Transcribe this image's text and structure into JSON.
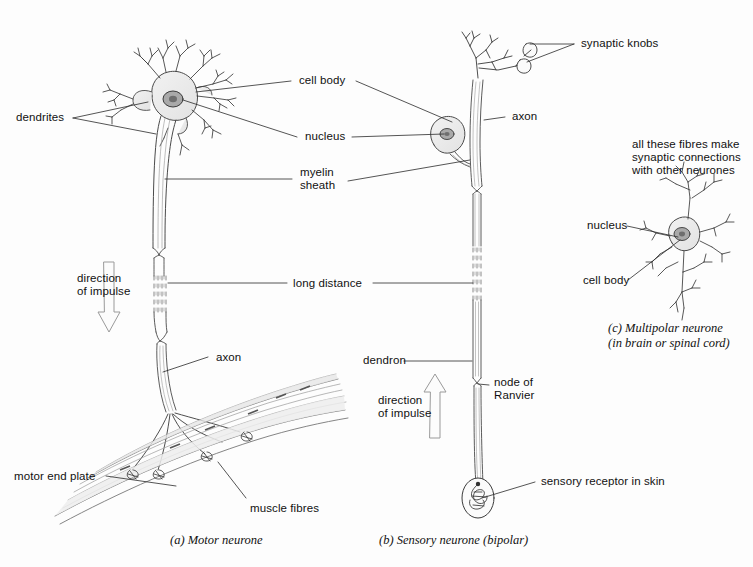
{
  "figure": {
    "background": "#fdfdfd",
    "ink": "#333333",
    "fill_light": "#e8e8e8"
  },
  "panels": {
    "a": {
      "caption_marker": "(a)",
      "caption_text": "Motor neurone",
      "labels": {
        "dendrites": "dendrites",
        "cell_body": "cell body",
        "nucleus": "nucleus",
        "myelin_sheath": "myelin\nsheath",
        "direction_of_impulse": "direction\nof impulse",
        "axon": "axon",
        "motor_end_plate": "motor end plate",
        "muscle_fibres": "muscle fibres"
      }
    },
    "b": {
      "caption_marker": "(b)",
      "caption_text": "Sensory neurone (bipolar)",
      "labels": {
        "synaptic_knobs": "synaptic knobs",
        "axon": "axon",
        "dendron": "dendron",
        "node_of_ranvier": "node of\nRanvier",
        "direction_of_impulse": "direction\nof impulse",
        "sensory_receptor": "sensory receptor in skin"
      }
    },
    "c": {
      "caption_marker": "(c)",
      "caption_text": "Multipolar neurone",
      "caption_text2": "(in brain or spinal cord)",
      "labels": {
        "fibres_note": "all these fibres make\nsynaptic connections\nwith other neurones",
        "nucleus": "nucleus",
        "cell_body": "cell body"
      }
    }
  },
  "shared": {
    "long_distance": "long distance"
  }
}
